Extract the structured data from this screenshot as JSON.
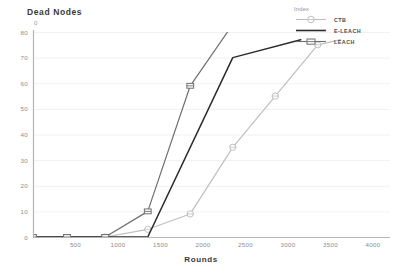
{
  "chart_data": {
    "type": "line",
    "title": "Dead Nodes",
    "xlabel": "Rounds",
    "ylabel": "Dead Nodes",
    "xlim": [
      0,
      4200
    ],
    "ylim": [
      0,
      80
    ],
    "grid": true,
    "legend_position": "top-right",
    "legend_title": "Index",
    "xticks": [
      500,
      1000,
      1500,
      2000,
      2500,
      3000,
      3500,
      4000
    ],
    "yticks": [
      0,
      10,
      20,
      30,
      40,
      50,
      60,
      70,
      80
    ],
    "series": [
      {
        "name": "CTB",
        "color": "#bfbfbf",
        "marker": "circle",
        "x": [
          0,
          400,
          850,
          1350,
          1850,
          2350,
          2850,
          3350,
          3620
        ],
        "y": [
          0,
          0,
          0,
          3,
          9,
          35,
          55,
          75,
          77
        ]
      },
      {
        "name": "E-LEACH",
        "color": "#2b2b2b",
        "marker": "none",
        "x": [
          0,
          400,
          850,
          1350,
          2350,
          3150
        ],
        "y": [
          0,
          0,
          0,
          0,
          70,
          77
        ]
      },
      {
        "name": "LEACH",
        "color": "#6f6f6f",
        "marker": "square",
        "x": [
          0,
          400,
          850,
          1350,
          1850,
          2330
        ],
        "y": [
          0,
          0,
          0,
          10,
          59,
          82
        ]
      }
    ]
  },
  "axes": {
    "y_axis_title": "Dead Nodes",
    "y_top_marker": "0",
    "x_axis_title": "Rounds",
    "ytick_labels": [
      "80",
      "70",
      "60",
      "50",
      "40",
      "30",
      "20",
      "10",
      "0"
    ],
    "xtick_labels": [
      "500",
      "1000",
      "1500",
      "2000",
      "2500",
      "3000",
      "3500",
      "4000"
    ]
  },
  "legend": {
    "title": "Index",
    "items": [
      {
        "label": "CTB",
        "color": "#bfbfbf",
        "marker": "circle"
      },
      {
        "label": "E-LEACH",
        "color": "#2b2b2b",
        "marker": "none"
      },
      {
        "label": "LEACH",
        "color": "#6f6f6f",
        "marker": "square"
      }
    ]
  },
  "colors": {
    "grid": "#ececec",
    "axis": "#b4b4b4",
    "text": "#8c8c8c",
    "title_text": "#3a3a3a",
    "background": "#ffffff"
  }
}
